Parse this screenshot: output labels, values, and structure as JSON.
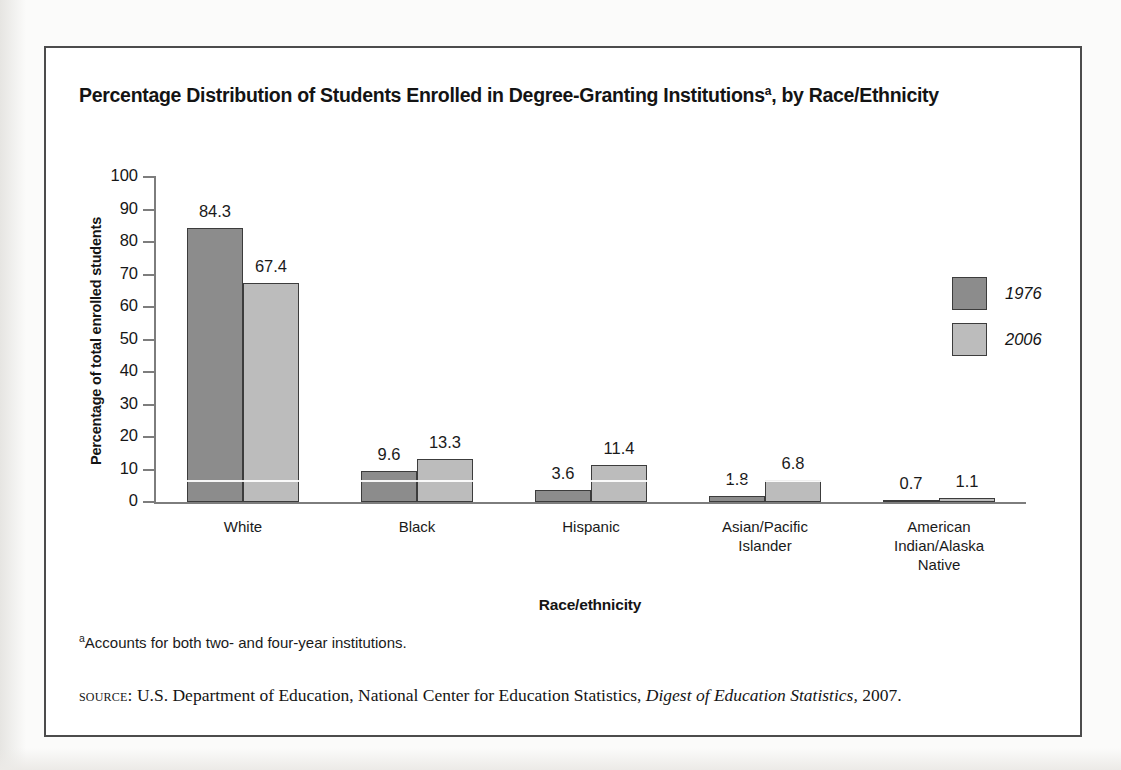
{
  "figure": {
    "title_main": "Percentage Distribution of Students Enrolled in Degree-Granting Institutions",
    "title_superscript": "a",
    "title_tail": ", by Race/Ethnicity",
    "footnote_marker": "a",
    "footnote_text": "Accounts for both two- and four-year institutions.",
    "source_kicker": "source:",
    "source_pre": " U.S. Department of Education, National Center for Education Statistics, ",
    "source_italic": "Digest of Education Statistics,",
    "source_post": " 2007."
  },
  "legend": {
    "items": [
      {
        "label": "1976",
        "color": "#8c8c8c"
      },
      {
        "label": "2006",
        "color": "#bcbcbc"
      }
    ]
  },
  "chart_data": {
    "type": "bar",
    "xlabel": "Race/ethnicity",
    "ylabel": "Percentage of total enrolled students",
    "ylim": [
      0,
      100
    ],
    "yticks": [
      0,
      10,
      20,
      30,
      40,
      50,
      60,
      70,
      80,
      90,
      100
    ],
    "ytick_labels": [
      "0",
      "10",
      "20",
      "30",
      "40",
      "50",
      "60",
      "70",
      "80",
      "90",
      "100"
    ],
    "grid": false,
    "legend_position": "right",
    "categories": [
      "White",
      "Black",
      "Hispanic",
      "Asian/Pacific Islander",
      "American Indian/Alaska Native"
    ],
    "category_lines": [
      [
        "White"
      ],
      [
        "Black"
      ],
      [
        "Hispanic"
      ],
      [
        "Asian/Pacific",
        "Islander"
      ],
      [
        "American",
        "Indian/Alaska",
        "Native"
      ]
    ],
    "series": [
      {
        "name": "1976",
        "color": "#8c8c8c",
        "values": [
          84.3,
          9.6,
          3.6,
          1.8,
          0.7
        ]
      },
      {
        "name": "2006",
        "color": "#bcbcbc",
        "values": [
          67.4,
          13.3,
          11.4,
          6.8,
          1.1
        ]
      }
    ],
    "data_labels": [
      [
        "84.3",
        "67.4"
      ],
      [
        "9.6",
        "13.3"
      ],
      [
        "3.6",
        "11.4"
      ],
      [
        "1.8",
        "6.8"
      ],
      [
        "0.7",
        "1.1"
      ]
    ]
  }
}
